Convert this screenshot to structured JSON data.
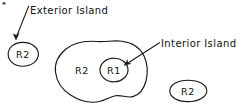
{
  "figure": {
    "background_color": "#ffffff",
    "ink_color": "#1a1a1a",
    "width": 241,
    "height": 111
  },
  "annotations": [
    {
      "id": "exterior",
      "label": "Exterior Island",
      "text_x": 30,
      "text_y": 14,
      "leader_from": [
        28.5,
        6.5
      ],
      "leader_to": [
        16.5,
        38.5
      ],
      "anchor": "start"
    },
    {
      "id": "interior",
      "label": "Interior Island",
      "text_x": 161,
      "text_y": 47,
      "leader_from": [
        158.5,
        43.5
      ],
      "leader_to": [
        124.5,
        65.0
      ],
      "anchor": "start"
    }
  ],
  "regions": [
    {
      "id": "exterior-island-left",
      "label": "R2",
      "shape": "ellipse",
      "text_x": 23,
      "text_y": 58,
      "cx": 23,
      "cy": 54,
      "rx": 15,
      "ry": 12
    },
    {
      "id": "outer-blob",
      "label": "R2",
      "shape": "blob",
      "text_x": 82,
      "text_y": 74
    },
    {
      "id": "interior-island",
      "label": "R1",
      "shape": "circle",
      "text_x": 114,
      "text_y": 74,
      "cx": 114,
      "cy": 70,
      "rx": 14,
      "ry": 12
    },
    {
      "id": "exterior-island-right",
      "label": "R2",
      "shape": "ellipse",
      "text_x": 188,
      "text_y": 95,
      "cx": 188,
      "cy": 91,
      "rx": 18,
      "ry": 11
    }
  ],
  "paths": {
    "outer_blob": "M 96 41 C 78 40 64 46 58 58 C 52 70 56 84 66 93 C 76 102 92 105 106 102 C 113 100 118 96 124 96 C 130 96 135 100 140 97 C 146 93 148 84 148 74 C 148 62 144 52 134 46 C 124 40 110 41.5 96 41 Z"
  },
  "specks": [
    {
      "x": 2.5,
      "y": 2.5,
      "w": 3,
      "h": 2.2
    }
  ]
}
